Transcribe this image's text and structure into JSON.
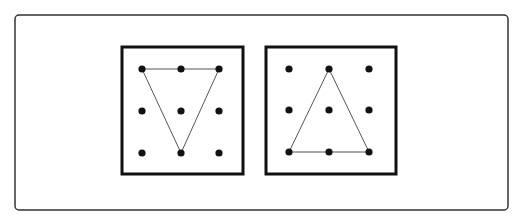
{
  "figure": {
    "background": "#ffffff",
    "stroke_color": "#111111",
    "line_color": "#555555",
    "outer_frame": {
      "x": 15,
      "y": 15,
      "w": 493,
      "h": 195,
      "rx": 4,
      "stroke_width": 1.5
    },
    "panels": [
      {
        "name": "left-geoboard",
        "frame": {
          "x": 122,
          "y": 47,
          "w": 121,
          "h": 127,
          "stroke_width": 3
        },
        "dots": {
          "cols": [
            142,
            181,
            219
          ],
          "rows": [
            69,
            111,
            153
          ],
          "radius": 3.6
        },
        "shape": "inverted-triangle",
        "triangle": [
          [
            142,
            69
          ],
          [
            219,
            69
          ],
          [
            181,
            153
          ]
        ]
      },
      {
        "name": "right-geoboard",
        "frame": {
          "x": 266,
          "y": 47,
          "w": 130,
          "h": 127,
          "stroke_width": 3
        },
        "dots": {
          "cols": [
            289,
            329,
            369
          ],
          "rows": [
            69,
            110,
            152
          ],
          "radius": 3.6
        },
        "shape": "upright-triangle",
        "triangle": [
          [
            329,
            69
          ],
          [
            289,
            152
          ],
          [
            369,
            152
          ]
        ]
      }
    ]
  }
}
